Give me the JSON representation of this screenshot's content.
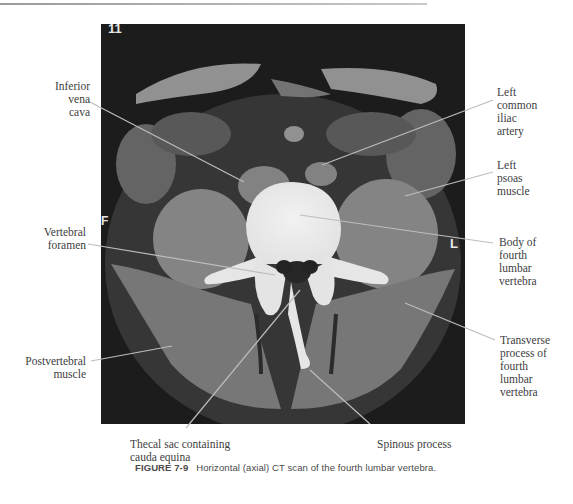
{
  "figure": {
    "number": "FIGURE 7-9",
    "caption": "Horizontal (axial) CT scan of the fourth lumbar vertebra."
  },
  "image": {
    "type": "CT scan",
    "markers": {
      "top_left": "11",
      "left": "F",
      "right": "L"
    }
  },
  "labels": {
    "inferior_vena_cava": "Inferior\nvena\ncava",
    "vertebral_foramen": "Vertebral\nforamen",
    "postvertebral_muscle": "Postvertebral\nmuscle",
    "thecal_sac": "Thecal sac containing\ncauda equina",
    "spinous_process": "Spinous process",
    "left_common_iliac_artery": "Left\ncommon\niliac\nartery",
    "left_psoas_muscle": "Left\npsoas\nmuscle",
    "body_of_vertebra": "Body of\nfourth\nlumbar\nvertebra",
    "transverse_process": "Transverse\nprocess of\nfourth\nlumbar\nvertebra"
  }
}
